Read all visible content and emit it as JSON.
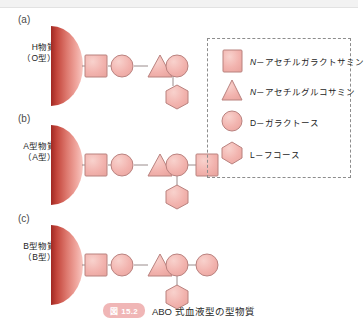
{
  "figure": {
    "caption_badge": "図 15.2",
    "caption_text": "ABO 式血液型の型物質",
    "colors": {
      "shape_fill": "#f2b3ae",
      "shape_stroke": "#b9827f",
      "membrane_dark": "#b5302a",
      "membrane_light": "#f0a79f",
      "legend_border": "#8d8d8d",
      "badge": "#f0b6b6",
      "link_line": "#9a8c8c"
    }
  },
  "panels": [
    {
      "letter": "(a)",
      "label_line1": "H物質",
      "label_line2": "（O型）",
      "chain": [
        "square",
        "circle",
        "triangle",
        "circle"
      ],
      "branch": {
        "from_index": 3,
        "shape": "hexagon"
      },
      "terminal": null
    },
    {
      "letter": "(b)",
      "label_line1": "A型物質",
      "label_line2": "（A型）",
      "chain": [
        "square",
        "circle",
        "triangle",
        "circle"
      ],
      "branch": {
        "from_index": 3,
        "shape": "hexagon"
      },
      "terminal": "square"
    },
    {
      "letter": "(c)",
      "label_line1": "B型物質",
      "label_line2": "（B型）",
      "chain": [
        "square",
        "circle",
        "triangle",
        "circle"
      ],
      "branch": {
        "from_index": 3,
        "shape": "hexagon"
      },
      "terminal": "circle"
    }
  ],
  "legend": {
    "items": [
      {
        "shape": "square",
        "prefix": "N",
        "name": "－アセチルガラクトサミン"
      },
      {
        "shape": "triangle",
        "prefix": "N",
        "name": "－アセチルグルコサミン"
      },
      {
        "shape": "circle",
        "prefix": "D",
        "name": "－ガラクトース"
      },
      {
        "shape": "hexagon",
        "prefix": "L",
        "name": "－フコース"
      }
    ]
  }
}
